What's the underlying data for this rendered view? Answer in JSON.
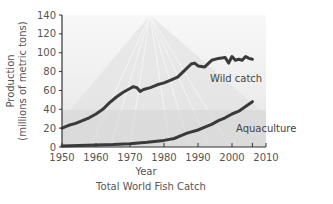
{
  "chart_data": {
    "type": "line",
    "title": "Total World Fish Catch",
    "xlabel": "Year",
    "ylabel": [
      "Production",
      "(millions of metric tons)"
    ],
    "xlim": [
      1950,
      2010
    ],
    "ylim": [
      0,
      140
    ],
    "xticks": [
      1950,
      1960,
      1970,
      1980,
      1990,
      2000,
      2010
    ],
    "yticks": [
      0,
      20,
      40,
      60,
      80,
      100,
      120,
      140
    ],
    "grid": false,
    "legend": "none",
    "annotations": [
      {
        "text": "Wild catch",
        "series": "Wild catch"
      },
      {
        "text": "Aquaculture",
        "series": "Aquaculture"
      }
    ],
    "series": [
      {
        "name": "Wild catch",
        "color": "#3a3a3a",
        "x": [
          1950,
          1952,
          1954,
          1956,
          1958,
          1960,
          1962,
          1964,
          1966,
          1968,
          1970,
          1971,
          1972,
          1973,
          1974,
          1976,
          1978,
          1980,
          1982,
          1984,
          1986,
          1988,
          1989,
          1990,
          1992,
          1994,
          1996,
          1998,
          1999,
          2000,
          2001,
          2002,
          2003,
          2004,
          2005,
          2006
        ],
        "values": [
          20,
          23,
          25,
          28,
          31,
          35,
          40,
          47,
          53,
          58,
          62,
          64,
          63,
          59,
          61,
          63,
          66,
          68,
          71,
          74,
          81,
          88,
          89,
          86,
          85,
          92,
          94,
          95,
          89,
          96,
          92,
          93,
          92,
          96,
          94,
          93
        ]
      },
      {
        "name": "Aquaculture",
        "color": "#3a3a3a",
        "x": [
          1950,
          1955,
          1960,
          1965,
          1970,
          1975,
          1980,
          1983,
          1985,
          1987,
          1989,
          1990,
          1992,
          1994,
          1996,
          1998,
          2000,
          2002,
          2004,
          2006
        ],
        "values": [
          1,
          1.5,
          2,
          2.5,
          3.5,
          5,
          7,
          9,
          12,
          15,
          17,
          18,
          21,
          24,
          28,
          31,
          35,
          38,
          43,
          48
        ]
      }
    ]
  }
}
